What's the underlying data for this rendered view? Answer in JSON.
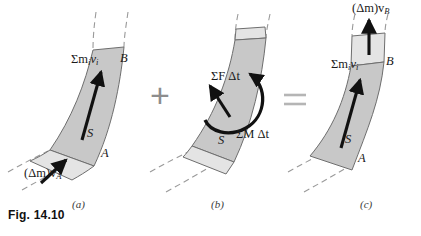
{
  "figure": {
    "caption": "Fig. 14.10",
    "subcaptions": [
      "(a)",
      "(b)",
      "(c)"
    ],
    "operators": {
      "plus": "+",
      "equals": "="
    },
    "colors": {
      "body_fill": "#c8c8c8",
      "slug_fill": "#e4e4e4",
      "outline": "#6e6e6e",
      "dashed": "#9a9a9a",
      "arrow": "#111111",
      "operator": "#8d8d8d",
      "text": "#1a1a1a"
    }
  },
  "panel_a": {
    "momentum_label": "Σm",
    "momentum_sub1": "i",
    "momentum_label2": "v",
    "momentum_sub2": "i",
    "inflow_label": "(Δm)v",
    "inflow_sub": "A",
    "point_b": "B",
    "point_a": "A",
    "system_label": "S"
  },
  "panel_b": {
    "force_impulse": "ΣF Δt",
    "moment_impulse": "ΣM Δt",
    "system_label": "S"
  },
  "panel_c": {
    "momentum_label": "Σm",
    "momentum_sub1": "i",
    "momentum_label2": "v",
    "momentum_sub2": "i",
    "outflow_label": "(Δm)v",
    "outflow_sub": "B",
    "point_b": "B",
    "point_a": "A",
    "system_label": "S"
  }
}
